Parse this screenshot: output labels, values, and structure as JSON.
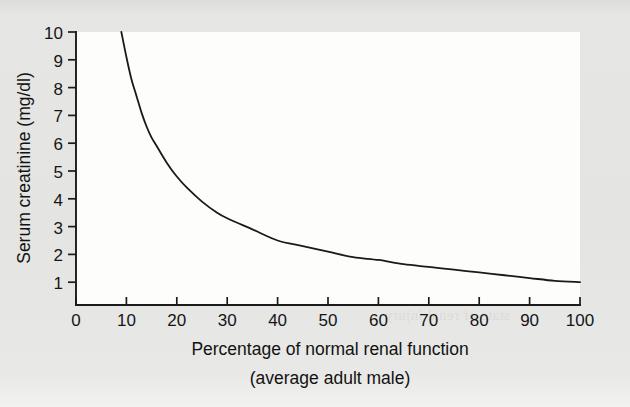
{
  "figure": {
    "background_color": "#e4e4e2",
    "plot_background_color": "#fdfdfc",
    "line_color": "#191919",
    "text_color": "#151515",
    "bleed_through_text": "the normal range and the\nserum creatinine begins to rise\nas renal function declines\n\nbecause of the reciprocal\nrelationship between serum\ncreatinine and glomerular\nfiltration rate in the steady\nstate of renal injury"
  },
  "chart_data": {
    "type": "line",
    "title": "",
    "xlabel": "Percentage of normal renal function",
    "xlabel_line2": "(average adult male)",
    "ylabel": "Serum creatinine (mg/dl)",
    "xlim": [
      0,
      100
    ],
    "ylim": [
      0,
      10
    ],
    "grid": false,
    "legend": false,
    "xticks": [
      0,
      10,
      20,
      30,
      40,
      50,
      60,
      70,
      80,
      90,
      100
    ],
    "xticklabels": [
      "0",
      "10",
      "20",
      "30",
      "40",
      "50",
      "60",
      "70",
      "80",
      "90",
      "100"
    ],
    "yticks": [
      1,
      2,
      3,
      4,
      5,
      6,
      7,
      8,
      9,
      10
    ],
    "yticklabels": [
      "1",
      "2",
      "3",
      "4",
      "5",
      "6",
      "7",
      "8",
      "9",
      "10"
    ],
    "series": [
      {
        "name": "Serum creatinine",
        "relationship": "inverse (serum creatinine is inversely proportional to percentage of normal renal function)",
        "x": [
          9,
          10,
          11,
          12,
          13,
          14,
          15,
          16,
          18,
          20,
          22,
          25,
          28,
          30,
          35,
          40,
          45,
          50,
          55,
          60,
          65,
          70,
          75,
          80,
          85,
          90,
          95,
          100
        ],
        "y": [
          10.0,
          9.1,
          8.3,
          7.7,
          7.1,
          6.6,
          6.2,
          5.9,
          5.3,
          4.8,
          4.4,
          3.9,
          3.5,
          3.3,
          2.9,
          2.5,
          2.3,
          2.1,
          1.9,
          1.8,
          1.65,
          1.55,
          1.45,
          1.35,
          1.25,
          1.15,
          1.05,
          1.0
        ]
      }
    ]
  }
}
